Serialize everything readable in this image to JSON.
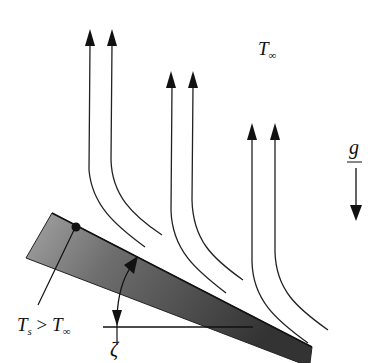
{
  "diagram": {
    "type": "free convection from inclined heated plate",
    "labels": {
      "ambient_temp": {
        "main": "T",
        "sub": "∞"
      },
      "gravity": "g",
      "surface_condition": {
        "lhs_main": "T",
        "lhs_sub": "s",
        "op": ">",
        "rhs_main": "T",
        "rhs_sub": "∞"
      },
      "angle": "ζ"
    },
    "streamlines": [
      {
        "pair": 1,
        "count": 2
      },
      {
        "pair": 2,
        "count": 2
      },
      {
        "pair": 3,
        "count": 2
      }
    ],
    "colors": {
      "line": "#222222",
      "plate_dark": "#3a3a3a",
      "plate_light": "#9a9a9a",
      "background": "#ffffff"
    }
  }
}
